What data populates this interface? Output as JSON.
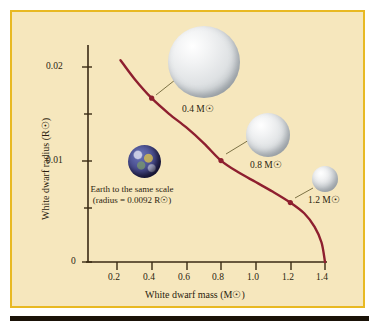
{
  "figure": {
    "background_color": "#f6e7bd",
    "frame_color": "#e8b923",
    "curve_color": "#8e1f2f",
    "axis_color": "#3a2a14"
  },
  "chart_data": {
    "type": "line",
    "title": "",
    "xlabel": "White dwarf mass (M☉)",
    "ylabel": "White dwarf radius (R☉)",
    "xlim": [
      0.0,
      1.45
    ],
    "ylim": [
      0.0,
      0.0215
    ],
    "grid": false,
    "legend": "none",
    "xticks": [
      0.2,
      0.4,
      0.6,
      0.8,
      1.0,
      1.2,
      1.4
    ],
    "xtick_labels": [
      "0.2",
      "0.4",
      "0.6",
      "0.8",
      "1.0",
      "1.2",
      "1.4"
    ],
    "yticks": [
      0,
      0.005,
      0.01,
      0.015,
      0.02
    ],
    "ytick_labels": [
      "0",
      "",
      "0.01",
      "",
      "0.02"
    ],
    "x": [
      0.22,
      0.3,
      0.4,
      0.5,
      0.6,
      0.7,
      0.8,
      0.9,
      1.0,
      1.1,
      1.2,
      1.28,
      1.34,
      1.38,
      1.4
    ],
    "y": [
      0.0207,
      0.0188,
      0.0168,
      0.0152,
      0.0138,
      0.0122,
      0.0104,
      0.0092,
      0.0082,
      0.0072,
      0.0061,
      0.005,
      0.0036,
      0.002,
      0.0
    ],
    "markers": [
      {
        "mass": 0.4,
        "radius": 0.0168,
        "label": "0.4 M☉"
      },
      {
        "mass": 0.8,
        "radius": 0.0104,
        "label": "0.8 M☉"
      },
      {
        "mass": 1.2,
        "radius": 0.0061,
        "label": "1.2 M☉"
      }
    ]
  },
  "spheres": [
    {
      "name": "white-dwarf-04",
      "label": "0.4 M☉"
    },
    {
      "name": "white-dwarf-08",
      "label": "0.8 M☉"
    },
    {
      "name": "white-dwarf-12",
      "label": "1.2 M☉"
    }
  ],
  "earth": {
    "note_line1": "Earth to the same scale",
    "note_line2": "(radius = 0.0092 R☉)",
    "radius_value": 0.0092
  }
}
